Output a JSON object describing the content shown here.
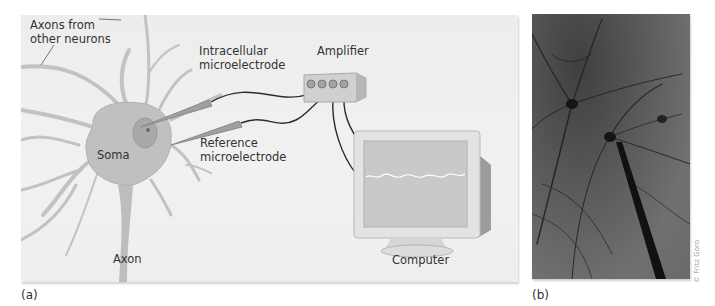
{
  "figure": {
    "panel_a": {
      "label": "(a)",
      "labels": {
        "axons_from_other_neurons_line1": "Axons from",
        "axons_from_other_neurons_line2": "other neurons",
        "intracellular_line1": "Intracellular",
        "intracellular_line2": "microelectrode",
        "reference_line1": "Reference",
        "reference_line2": "microelectrode",
        "amplifier": "Amplifier",
        "soma": "Soma",
        "axon": "Axon",
        "computer": "Computer"
      },
      "colors": {
        "background": "#efefef",
        "neuron": "#bdbdbd",
        "nucleus": "#a5a5a5",
        "electrode": "#9a9a9a",
        "wire": "#2b2b2b",
        "screen": "#c9c9c9",
        "trace": "#ffffff"
      }
    },
    "panel_b": {
      "label": "(b)",
      "credit": "© Fritz Goro"
    }
  }
}
